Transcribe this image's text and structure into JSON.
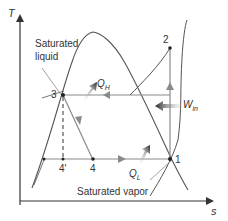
{
  "diagram": {
    "axes": {
      "x_label": "s",
      "y_label": "T"
    },
    "labels": {
      "saturated_liquid_line1": "Saturated",
      "saturated_liquid_line2": "liquid",
      "saturated_vapor": "Saturated vapor",
      "qh_main": "Q",
      "qh_sub": "H",
      "ql_main": "Q",
      "ql_sub": "L",
      "win_main": "W",
      "win_sub": "in"
    },
    "states": [
      {
        "id": "1",
        "label": "1"
      },
      {
        "id": "2",
        "label": "2"
      },
      {
        "id": "3",
        "label": "3"
      },
      {
        "id": "4",
        "label": "4"
      },
      {
        "id": "4p",
        "label": "4'"
      }
    ],
    "colors": {
      "curve": "#555555",
      "process_line": "#8a8a8a",
      "axis": "#333333",
      "heat_arrow": "#2a2a2a",
      "text": "#333333"
    }
  }
}
